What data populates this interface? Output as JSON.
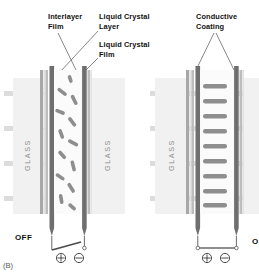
{
  "figure": {
    "id": "(B)",
    "title_labels": [
      {
        "name": "interlayer-film",
        "text_line1": "Interlayer",
        "text_line2": "Film"
      },
      {
        "name": "liquid-crystal-layer",
        "text_line1": "Liquid Crystal",
        "text_line2": "Layer"
      },
      {
        "name": "liquid-crystal-film",
        "text_line1": "Liquid Crystal",
        "text_line2": "Film"
      },
      {
        "name": "conductive-coating",
        "text_line1": "Conductive",
        "text_line2": "Coating"
      }
    ]
  },
  "labels": {
    "interlayer_film_l1": "Interlayer",
    "interlayer_film_l2": "Film",
    "lc_layer_l1": "Liquid Crystal",
    "lc_layer_l2": "Layer",
    "lc_film_l1": "Liquid Crystal",
    "lc_film_l2": "Film",
    "conductive_coating_l1": "Conductive",
    "conductive_coating_l2": "Coating",
    "figure_id": "(B)"
  },
  "panels": [
    {
      "name": "off-panel",
      "state": "OFF",
      "state_label": "OFF",
      "glass_text": "GLASS",
      "crystal_orientation": "random",
      "light_passes": false,
      "switch": {
        "closed": false,
        "positive": "+",
        "negative": "−"
      }
    },
    {
      "name": "on-panel",
      "state": "ON",
      "state_label": "O",
      "glass_text": "GLASS",
      "crystal_orientation": "aligned-horizontal",
      "light_passes": true,
      "switch": {
        "closed": true,
        "positive": "+",
        "negative": "−"
      }
    }
  ],
  "terminals": {
    "plus": "+",
    "minus": "−"
  },
  "colors": {
    "background": "#ffffff",
    "glass": "#f0f0f0",
    "electrode": "#6f6f6f",
    "film": "#c9c9c9",
    "interlayer": "#b4b4b4",
    "crystal": "#8a8a8a",
    "light_ray": "#dcdcdc",
    "text": "#111111",
    "glass_text": "#8d8d8d",
    "leader": "#555555"
  }
}
